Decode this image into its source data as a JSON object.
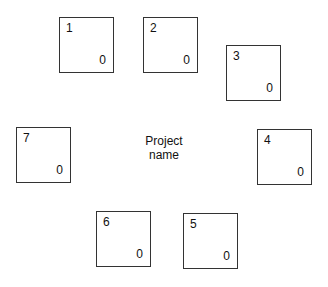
{
  "center_label": {
    "line1": "Project",
    "line2": "name"
  },
  "boxes": [
    {
      "id": "1",
      "value": "0"
    },
    {
      "id": "2",
      "value": "0"
    },
    {
      "id": "3",
      "value": "0"
    },
    {
      "id": "4",
      "value": "0"
    },
    {
      "id": "5",
      "value": "0"
    },
    {
      "id": "6",
      "value": "0"
    },
    {
      "id": "7",
      "value": "0"
    }
  ]
}
